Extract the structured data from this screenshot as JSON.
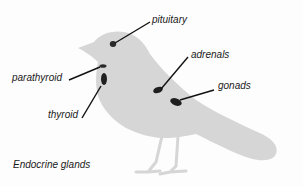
{
  "diagram": {
    "caption": "Endocrine glands",
    "colors": {
      "background": "#fdfdfd",
      "bird": "#d6d6d6",
      "gland": "#2a2a2a",
      "leader_line": "#111111",
      "text": "#1a1a1a"
    },
    "labels": [
      {
        "id": "pituitary",
        "text": "pituitary"
      },
      {
        "id": "parathyroid",
        "text": "parathyroid"
      },
      {
        "id": "adrenals",
        "text": "adrenals"
      },
      {
        "id": "thyroid",
        "text": "thyroid"
      },
      {
        "id": "gonads",
        "text": "gonads"
      }
    ]
  }
}
